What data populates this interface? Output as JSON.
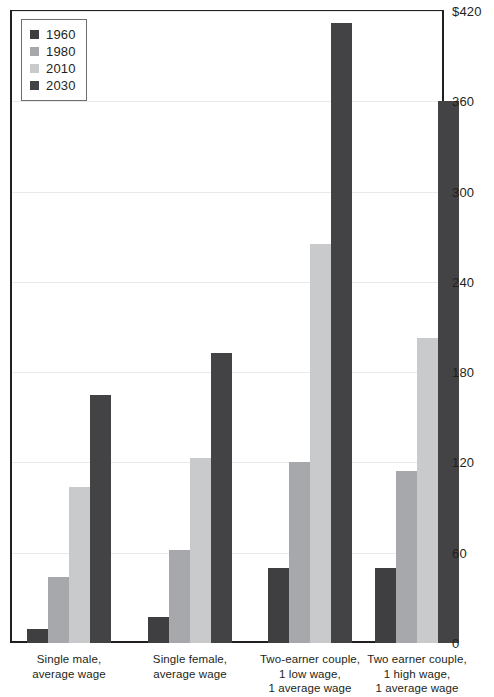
{
  "chart_data": {
    "type": "bar",
    "title": "",
    "subtitle": "",
    "xlabel": "",
    "ylabel": "",
    "ylim": [
      0,
      420
    ],
    "yticks": [
      0,
      60,
      120,
      180,
      240,
      300,
      360,
      420
    ],
    "ytick_labels": [
      "0",
      "60",
      "120",
      "180",
      "240",
      "300",
      "360",
      "$420"
    ],
    "grid": true,
    "legend_position": "top-left",
    "categories": [
      "Single male, average wage",
      "Single female, average wage",
      "Two-earner couple, 1 low wage, 1 average wage",
      "Two earner couple, 1 high wage, 1 average wage"
    ],
    "category_label_lines": [
      [
        "Single male,",
        "average wage"
      ],
      [
        "Single female,",
        "average wage"
      ],
      [
        "Two-earner couple,",
        "1 low wage,",
        "1 average wage"
      ],
      [
        "Two earner couple,",
        "1 high wage,",
        "1 average wage"
      ]
    ],
    "series": [
      {
        "name": "1960",
        "color": "#3f3f41",
        "values": [
          9,
          17,
          50,
          50
        ]
      },
      {
        "name": "1980",
        "color": "#a6a8ab",
        "values": [
          44,
          62,
          120,
          114
        ]
      },
      {
        "name": "2010",
        "color": "#c8cacc",
        "values": [
          104,
          123,
          265,
          203
        ]
      },
      {
        "name": "2030",
        "color": "#434244",
        "values": [
          165,
          193,
          412,
          360
        ]
      }
    ]
  },
  "legend": {
    "items": [
      {
        "label": "1960",
        "color": "#3f3f41"
      },
      {
        "label": "1980",
        "color": "#a6a8ab"
      },
      {
        "label": "2010",
        "color": "#c8cacc"
      },
      {
        "label": "2030",
        "color": "#434244"
      }
    ]
  },
  "axis": {
    "y_tick_labels": [
      "$420",
      "360",
      "300",
      "240",
      "180",
      "120",
      "60",
      "0"
    ]
  }
}
